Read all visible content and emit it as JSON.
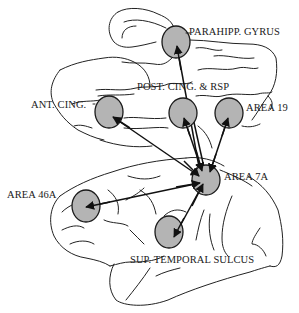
{
  "figure": {
    "colors": {
      "region_fill": "#b4b4b4",
      "stroke": "#1a1a1a",
      "background": "#ffffff"
    }
  },
  "regions": [
    {
      "id": "parahipp",
      "label": "PARAHIPP. GYRUS",
      "cx": 176,
      "cy": 42,
      "r": 14
    },
    {
      "id": "antcing",
      "label": "ANT. CING.",
      "cx": 109,
      "cy": 112,
      "r": 15
    },
    {
      "id": "postcing",
      "label": "POST. CING. & RSP",
      "cx": 183,
      "cy": 113,
      "r": 14
    },
    {
      "id": "area19",
      "label": "AREA 19",
      "cx": 229,
      "cy": 113,
      "r": 14
    },
    {
      "id": "area7a",
      "label": "AREA 7A",
      "cx": 206,
      "cy": 180,
      "r": 14
    },
    {
      "id": "area46a",
      "label": "AREA 46A",
      "cx": 86,
      "cy": 206,
      "r": 15
    },
    {
      "id": "sts",
      "label": "SUP. TEMPORAL SULCUS",
      "cx": 169,
      "cy": 232,
      "r": 14
    }
  ],
  "connections": [
    {
      "from": "area7a",
      "to": "parahipp",
      "bidirectional": false
    },
    {
      "from": "area7a",
      "to": "antcing",
      "bidirectional": true
    },
    {
      "from": "area7a",
      "to": "postcing",
      "bidirectional": true
    },
    {
      "from": "area7a",
      "to": "area19",
      "bidirectional": true
    },
    {
      "from": "area7a",
      "to": "area46a",
      "bidirectional": true
    },
    {
      "from": "area7a",
      "to": "sts",
      "bidirectional": true
    }
  ]
}
